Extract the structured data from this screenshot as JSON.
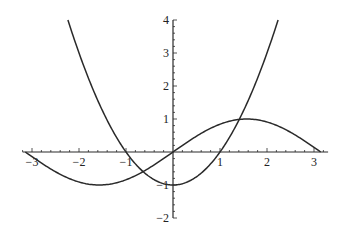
{
  "chart_data": {
    "type": "line",
    "title": "",
    "xlabel": "",
    "ylabel": "",
    "xlim": [
      -3.2,
      3.3
    ],
    "ylim": [
      -2,
      4
    ],
    "grid": false,
    "legend": null,
    "x_ticks": [
      -3,
      -2,
      -1,
      1,
      2,
      3
    ],
    "y_ticks": [
      -2,
      -1,
      1,
      2,
      3,
      4
    ],
    "x_tick_labels": [
      "-3",
      "-2",
      "-1",
      "1",
      "2",
      "3"
    ],
    "y_tick_labels": [
      "-2",
      "-1",
      "1",
      "2",
      "3",
      "4"
    ],
    "series": [
      {
        "name": "sin(x)",
        "domain": [
          -3.1416,
          3.1416
        ],
        "x": [
          -3.14,
          -2.5,
          -2,
          -1.57,
          -1,
          -0.5,
          0,
          0.5,
          1,
          1.57,
          2,
          2.5,
          3.14
        ],
        "values": [
          0,
          -0.6,
          -0.91,
          -1,
          -0.84,
          -0.48,
          0,
          0.48,
          0.84,
          1,
          0.91,
          0.6,
          0
        ]
      },
      {
        "name": "x^2 - 1",
        "domain": [
          -2.236,
          2.236
        ],
        "x": [
          -2.236,
          -2,
          -1.5,
          -1,
          -0.5,
          0,
          0.5,
          1,
          1.5,
          2,
          2.236
        ],
        "values": [
          4,
          3,
          1.25,
          0,
          -0.75,
          -1,
          -0.75,
          0,
          1.25,
          3,
          4
        ]
      }
    ],
    "color": "#2a2a2a"
  },
  "layout": {
    "origin_px": [
      173,
      152
    ],
    "x_unit_px": 47,
    "y_unit_px": 33
  }
}
